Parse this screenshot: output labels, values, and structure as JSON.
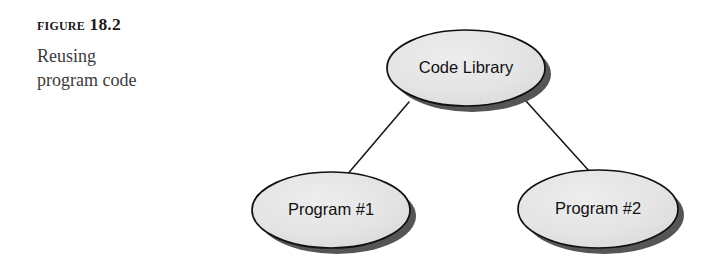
{
  "figure": {
    "label": "Figure 18.2",
    "caption_lines": [
      "Reusing",
      "program code"
    ]
  },
  "colors": {
    "page_background": "#ffffff",
    "node_fill": "#e3e3e3",
    "node_fill_highlight": "#ededed",
    "node_stroke": "#101010",
    "node_shadow": "#555555",
    "connector_stroke": "#1a1a1a",
    "label_text": "#111111",
    "figure_label_text": "#1a1a1a",
    "caption_text": "#3a3a3a"
  },
  "diagram": {
    "type": "node-link",
    "nodes": [
      {
        "id": "code-library",
        "label": "Code Library",
        "shape": "ellipse",
        "cx": 466,
        "cy": 68,
        "rx": 79,
        "ry": 38
      },
      {
        "id": "program-1",
        "label": "Program #1",
        "shape": "ellipse",
        "cx": 331,
        "cy": 210,
        "rx": 79,
        "ry": 38
      },
      {
        "id": "program-2",
        "label": "Program #2",
        "shape": "ellipse",
        "cx": 598,
        "cy": 209,
        "rx": 80,
        "ry": 39
      }
    ],
    "edges": [
      {
        "id": "edge-library-program1",
        "from": "code-library",
        "to": "program-1",
        "x1": 409,
        "y1": 102,
        "x2": 346,
        "y2": 176
      },
      {
        "id": "edge-library-program2",
        "from": "code-library",
        "to": "program-2",
        "x1": 526,
        "y1": 101,
        "x2": 590,
        "y2": 172
      }
    ]
  }
}
